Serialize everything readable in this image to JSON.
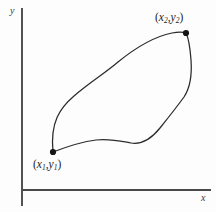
{
  "figure": {
    "kind": "path-independence-diagram",
    "background_color": "#fdfdfd",
    "curve_color": "#2b2b2b",
    "axis_color": "#4a4a4a",
    "dot_color": "#141414",
    "axes": {
      "x_label": "x",
      "y_label": "y",
      "origin": {
        "x": 22,
        "y": 190
      },
      "x_axis_end": {
        "x": 211,
        "y": 190
      },
      "y_axis_top": {
        "x": 22,
        "y": 8
      },
      "y_axis_bottom": {
        "x": 22,
        "y": 206
      }
    },
    "points": [
      {
        "id": "p1",
        "open_paren": "(",
        "var_x": "x",
        "sub_x": "1",
        "comma": ",",
        "var_y": "y",
        "sub_y": "1",
        "close_paren": ")",
        "text": "(x1,y1)",
        "coords": {
          "x": 53,
          "y": 152
        }
      },
      {
        "id": "p2",
        "open_paren": "(",
        "var_x": "x",
        "sub_x": "2",
        "comma": ",",
        "var_y": "y",
        "sub_y": "2",
        "close_paren": ")",
        "text": "(x2,y2)",
        "coords": {
          "x": 186,
          "y": 33
        }
      }
    ],
    "curves": [
      {
        "id": "upper-path",
        "name": "upper-curve",
        "d": "M 53 152 C 50 122, 60 108, 74 96 C 90 82, 104 74, 118 62 C 134 49, 152 37, 172 33 C 179 31.5, 183.5 32, 186 33"
      },
      {
        "id": "lower-path",
        "name": "lower-curve",
        "d": "M 53 152 C 66 147, 80 142, 96 140 C 110 138.5, 120 141, 131 143 C 143 145, 152 138, 160 128 C 168 118, 176 108, 184 97 C 190 88, 192 74, 191 60 C 190 46, 188 37, 186 33"
      }
    ]
  }
}
